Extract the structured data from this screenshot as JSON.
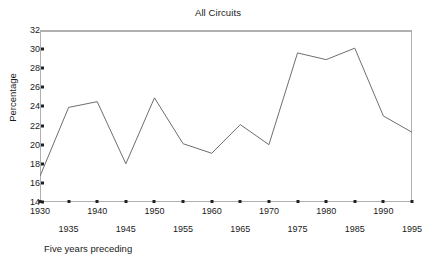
{
  "chart_data": {
    "type": "line",
    "title": "All Circuits",
    "xlabel": "Five years preceding",
    "ylabel": "Percentage",
    "x": [
      1930,
      1935,
      1940,
      1945,
      1950,
      1955,
      1960,
      1965,
      1970,
      1975,
      1980,
      1985,
      1990,
      1995
    ],
    "values": [
      16.7,
      23.9,
      24.5,
      18.0,
      24.9,
      20.1,
      19.1,
      22.1,
      20.0,
      29.6,
      28.9,
      30.1,
      23.0,
      21.3
    ],
    "series": [
      {
        "name": "All Circuits",
        "values": [
          16.7,
          23.9,
          24.5,
          18.0,
          24.9,
          20.1,
          19.1,
          22.1,
          20.0,
          29.6,
          28.9,
          30.1,
          23.0,
          21.3
        ]
      }
    ],
    "xlim": [
      1930,
      1995
    ],
    "ylim": [
      14,
      32
    ],
    "y_ticks": [
      14,
      16,
      18,
      20,
      22,
      24,
      26,
      28,
      30,
      32
    ],
    "y_tick_labels": [
      "14",
      "16",
      "18",
      "20",
      "22",
      "24",
      "26",
      "28",
      "30",
      "32"
    ],
    "x_ticks": [
      1930,
      1935,
      1940,
      1945,
      1950,
      1955,
      1960,
      1965,
      1970,
      1975,
      1980,
      1985,
      1990,
      1995
    ],
    "x_tick_labels_top": [
      "1930",
      "1940",
      "1950",
      "1960",
      "1970",
      "1980",
      "1990"
    ],
    "x_tick_labels_bottom": [
      "1935",
      "1945",
      "1955",
      "1965",
      "1975",
      "1985",
      "1995"
    ],
    "grid": false,
    "legend": "none",
    "line_color": "#6e6e6e",
    "frame_color": "#b0b0b0",
    "text_color": "#1a1a1a"
  }
}
